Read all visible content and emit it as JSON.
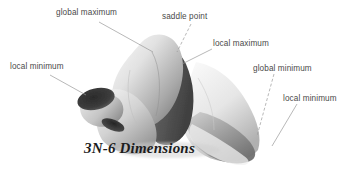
{
  "figure": {
    "caption": "3N-6 Dimensions",
    "background_color": "#ffffff",
    "label_color": "#4a4a4a",
    "leader_color": "#9a9a9a",
    "surface_light": "#f2f2f2",
    "surface_mid": "#b4b4b4",
    "surface_dark": "#3a3a3a",
    "annotations": [
      {
        "id": "global-maximum",
        "text": "global maximum",
        "label_x": 56,
        "label_y": 8,
        "leader": [
          [
            99,
            22
          ],
          [
            153,
            52
          ]
        ]
      },
      {
        "id": "saddle-point",
        "text": "saddle point",
        "label_x": 162,
        "label_y": 12,
        "leader": [
          [
            191,
            24
          ],
          [
            177,
            52
          ]
        ]
      },
      {
        "id": "local-maximum",
        "text": "local maximum",
        "label_x": 213,
        "label_y": 39,
        "leader": [
          [
            212,
            49
          ],
          [
            182,
            64
          ]
        ]
      },
      {
        "id": "local-minimum-left",
        "text": "local minimum",
        "label_x": 10,
        "label_y": 62,
        "leader": [
          [
            50,
            75
          ],
          [
            86,
            95
          ]
        ]
      },
      {
        "id": "global-minimum",
        "text": "global minimum",
        "label_x": 253,
        "label_y": 64,
        "leader": [
          [
            274,
            74
          ],
          [
            257,
            136
          ]
        ]
      },
      {
        "id": "local-minimum-right",
        "text": "local minimum",
        "label_x": 283,
        "label_y": 94,
        "leader": [
          [
            297,
            104
          ],
          [
            272,
            146
          ]
        ]
      }
    ],
    "caption_x": 84,
    "caption_y": 140
  }
}
